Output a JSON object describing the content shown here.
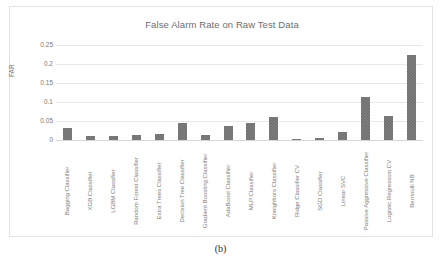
{
  "caption": "(b)",
  "chart_data": {
    "type": "bar",
    "title": "False Alarm Rate on Raw Test Data",
    "xlabel": "",
    "ylabel": "FAR",
    "ylim": [
      0,
      0.25
    ],
    "grid": true,
    "legend": "none",
    "yticks": [
      "0.25",
      "0.2",
      "0.15",
      "0.1",
      "0.05",
      "0"
    ],
    "ytick_values": [
      0.25,
      0.2,
      0.15,
      0.1,
      0.05,
      0
    ],
    "bar_color": "#6b6b6b",
    "categories": [
      "Bagging Classifier",
      "XGB Classifier",
      "LGBM Classifier",
      "Random Forest Classifier",
      "Extra Trees Classifier",
      "Decision Tree Classifier",
      "Gradient Boosting Classifier",
      "AdaBoost Classifier",
      "MLP Classifier",
      "Kneighbors Classifier",
      "Ridge Classifier CV",
      "SGD Classifier",
      "Linear SVC",
      "Passive Aggressive Classifier",
      "Logistic Regression CV",
      "Bernoulli NB"
    ],
    "values": [
      0.031,
      0.011,
      0.011,
      0.014,
      0.015,
      0.045,
      0.012,
      0.036,
      0.044,
      0.06,
      0.001,
      0.005,
      0.02,
      0.112,
      0.062,
      0.223
    ]
  }
}
